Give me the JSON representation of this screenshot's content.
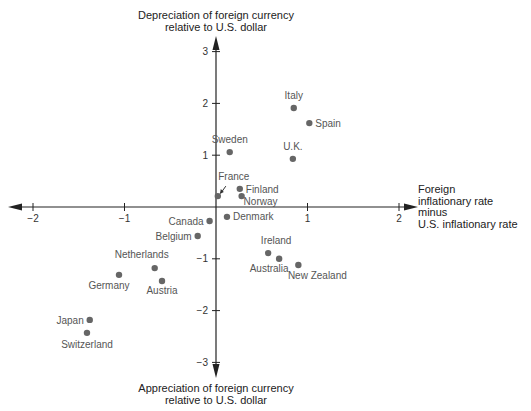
{
  "chart_data": {
    "type": "scatter",
    "title": "",
    "xlabel": "Foreign inflationary rate minus U.S. inflationary rate",
    "ylabel_top": "Depreciation of foreign currency relative to U.S. dollar",
    "ylabel_bottom": "Appreciation of foreign currency relative to U.S. dollar",
    "xlim": [
      -2.2,
      2.2
    ],
    "ylim": [
      -3.3,
      3.3
    ],
    "x_ticks": [
      -2,
      -1,
      1,
      2
    ],
    "y_ticks": [
      3,
      2,
      1,
      -1,
      -2,
      -3
    ],
    "grid": false,
    "legend": null,
    "points": [
      {
        "label": "Italy",
        "x": 0.85,
        "y": 1.91
      },
      {
        "label": "Spain",
        "x": 1.02,
        "y": 1.62
      },
      {
        "label": "Sweden",
        "x": 0.15,
        "y": 1.06
      },
      {
        "label": "U.K.",
        "x": 0.84,
        "y": 0.93
      },
      {
        "label": "France",
        "x": 0.02,
        "y": 0.21
      },
      {
        "label": "Finland",
        "x": 0.26,
        "y": 0.35
      },
      {
        "label": "Norway",
        "x": 0.28,
        "y": 0.21
      },
      {
        "label": "Denmark",
        "x": 0.12,
        "y": -0.19
      },
      {
        "label": "Canada",
        "x": -0.07,
        "y": -0.27
      },
      {
        "label": "Belgium",
        "x": -0.2,
        "y": -0.56
      },
      {
        "label": "Ireland",
        "x": 0.57,
        "y": -0.89
      },
      {
        "label": "Australia",
        "x": 0.69,
        "y": -1.0
      },
      {
        "label": "New Zealand",
        "x": 0.9,
        "y": -1.12
      },
      {
        "label": "Netherlands",
        "x": -0.67,
        "y": -1.18
      },
      {
        "label": "Germany",
        "x": -1.06,
        "y": -1.31
      },
      {
        "label": "Austria",
        "x": -0.59,
        "y": -1.43
      },
      {
        "label": "Japan",
        "x": -1.38,
        "y": -2.18
      },
      {
        "label": "Switzerland",
        "x": -1.41,
        "y": -2.43
      }
    ]
  },
  "labels": {
    "y_top_line1": "Depreciation of foreign currency",
    "y_top_line2": "relative to U.S. dollar",
    "y_bottom_line1": "Appreciation of foreign currency",
    "y_bottom_line2": "relative to U.S. dollar",
    "x_line1": "Foreign",
    "x_line2": "inflationary rate",
    "x_line3": "minus",
    "x_line4": "U.S. inflationary rate"
  },
  "style": {
    "dot_color": "#666666",
    "axis_color": "#222222",
    "label_color": "#555555"
  }
}
